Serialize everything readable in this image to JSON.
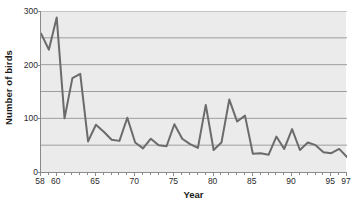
{
  "chart_data": {
    "type": "line",
    "title": "",
    "xlabel": "Year",
    "ylabel": "Number of birds",
    "xlim": [
      58,
      97
    ],
    "ylim": [
      0,
      300
    ],
    "grid": true,
    "legend": "none",
    "y_ticks_major": [
      0,
      100,
      200,
      300
    ],
    "y_ticks_minor": [
      50,
      150,
      250
    ],
    "y_tick_labels": [
      "0",
      "100",
      "200",
      "300"
    ],
    "x_tick_labels": [
      "58",
      "60",
      "65",
      "70",
      "75",
      "80",
      "85",
      "90",
      "95",
      "97"
    ],
    "x_tick_label_values": [
      58,
      60,
      65,
      70,
      75,
      80,
      85,
      90,
      95,
      97
    ],
    "x": [
      58,
      59,
      60,
      61,
      62,
      63,
      64,
      65,
      66,
      67,
      68,
      69,
      70,
      71,
      72,
      73,
      74,
      75,
      76,
      77,
      78,
      79,
      80,
      81,
      82,
      83,
      84,
      85,
      86,
      87,
      88,
      89,
      90,
      91,
      92,
      93,
      94,
      95,
      96,
      97
    ],
    "values": [
      258,
      228,
      288,
      100,
      175,
      183,
      57,
      88,
      75,
      60,
      58,
      101,
      55,
      44,
      62,
      50,
      48,
      89,
      62,
      52,
      45,
      125,
      41,
      55,
      135,
      94,
      105,
      34,
      35,
      32,
      66,
      43,
      80,
      41,
      55,
      50,
      37,
      35,
      43,
      28
    ],
    "series": [
      {
        "name": "Number of birds",
        "color": "#6b6b6b",
        "line_width": 2,
        "values": [
          258,
          228,
          288,
          100,
          175,
          183,
          57,
          88,
          75,
          60,
          58,
          101,
          55,
          44,
          62,
          50,
          48,
          89,
          62,
          52,
          45,
          125,
          41,
          55,
          135,
          94,
          105,
          34,
          35,
          32,
          66,
          43,
          80,
          41,
          55,
          50,
          37,
          35,
          43,
          28
        ]
      }
    ]
  },
  "colors": {
    "plot_background": "#ebebeb",
    "gridline": "#9e9e9e",
    "axis": "#8a8a8a",
    "line": "#6b6b6b",
    "text": "#1a1a1a"
  }
}
